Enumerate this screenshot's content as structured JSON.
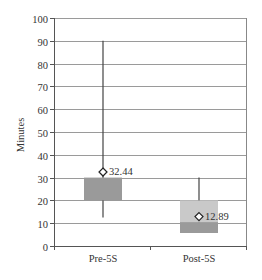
{
  "chart_data": {
    "type": "box",
    "title": "",
    "xlabel": "",
    "ylabel": "Minutes",
    "ylim": [
      0,
      100
    ],
    "yticks": [
      0,
      10,
      20,
      30,
      40,
      50,
      60,
      70,
      80,
      90,
      100
    ],
    "grid": true,
    "legend": null,
    "categories": [
      "Pre-5S",
      "Post-5S"
    ],
    "series": [
      {
        "name": "Pre-5S",
        "whisker_low": 12.5,
        "q1": 20,
        "median": 20,
        "q3": 30,
        "whisker_high": 90,
        "mean": 32.44,
        "mean_label": "32.44"
      },
      {
        "name": "Post-5S",
        "whisker_low": 5.7,
        "q1": 5.7,
        "median": 10.5,
        "q3": 20,
        "whisker_high": 30,
        "mean": 12.89,
        "mean_label": "12.89"
      }
    ],
    "colors": {
      "box_dark": "#9a9a9a",
      "box_light": "#c9c9c9",
      "gridline": "#9a9a9a",
      "axis": "#555555",
      "whisker": "#444444"
    }
  }
}
